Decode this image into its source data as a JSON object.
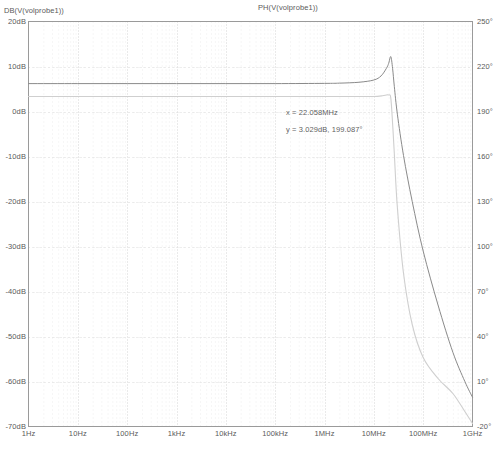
{
  "window": {
    "title": "AC Analysis Waveform Viewer"
  },
  "titles": {
    "left_trace": "DB(V(volprobe1))",
    "right_trace": "PH(V(volprobe1))"
  },
  "annotation": {
    "x_line": "x = 22.058MHz",
    "y_line": "y = 3.029dB, 199.087°"
  },
  "colors": {
    "magnitude_trace": "#8a8a8a",
    "phase_trace": "#cfcfcf",
    "frame": "#9a9a9a",
    "grid_major": "#d8d8d8",
    "grid_minor": "#e2e2e2",
    "text": "#5a5a5a",
    "background": "#ffffff"
  },
  "chart_data": {
    "type": "line",
    "title": "",
    "subtitle": "",
    "xlabel": "",
    "x_scale": "log",
    "xlim": [
      1,
      1000000000
    ],
    "xticks": [
      1,
      10,
      100,
      1000,
      10000,
      100000,
      1000000,
      10000000,
      100000000,
      1000000000
    ],
    "xticklabels": [
      "1Hz",
      "10Hz",
      "100Hz",
      "1kHz",
      "10kHz",
      "100kHz",
      "1MHz",
      "10MHz",
      "100MHz",
      "1GHz"
    ],
    "grid": true,
    "legend_position": "top",
    "axes": [
      {
        "name": "magnitude",
        "side": "left",
        "ylabel": "",
        "ylim": [
          -70,
          20
        ],
        "yticks": [
          20,
          10,
          0,
          -10,
          -20,
          -30,
          -40,
          -50,
          -60,
          -70
        ],
        "yticklabels": [
          "20dB",
          "10dB",
          "0dB",
          "-10dB",
          "-20dB",
          "-30dB",
          "-40dB",
          "-50dB",
          "-60dB",
          "-70dB"
        ]
      },
      {
        "name": "phase",
        "side": "right",
        "ylabel": "",
        "ylim": [
          -20,
          250
        ],
        "yticks": [
          250,
          220,
          190,
          160,
          130,
          100,
          70,
          40,
          10,
          -20
        ],
        "yticklabels": [
          "250°",
          "220°",
          "190°",
          "160°",
          "130°",
          "100°",
          "70°",
          "40°",
          "10°",
          "-20°"
        ]
      }
    ],
    "series": [
      {
        "name": "DB(V(volprobe1))",
        "axis": "magnitude",
        "units": "dB",
        "color": "#8a8a8a",
        "x": [
          1,
          10,
          100,
          1000,
          10000,
          100000,
          1000000,
          2000000,
          5000000,
          10000000,
          14000000,
          18000000,
          20000000,
          22058000,
          24000000,
          26000000,
          30000000,
          40000000,
          60000000,
          100000000,
          200000000,
          400000000,
          700000000,
          1000000000
        ],
        "y": [
          6.2,
          6.2,
          6.2,
          6.2,
          6.2,
          6.2,
          6.25,
          6.3,
          6.5,
          7.0,
          7.9,
          9.6,
          10.7,
          12.2,
          9.6,
          5.6,
          -0.6,
          -9.8,
          -20.0,
          -31.0,
          -43.0,
          -53.5,
          -60.0,
          -63.5
        ]
      },
      {
        "name": "PH(V(volprobe1))",
        "axis": "phase",
        "units": "deg",
        "color": "#cfcfcf",
        "x": [
          1,
          10,
          100,
          1000,
          10000,
          100000,
          1000000,
          5000000,
          10000000,
          15000000,
          18000000,
          20000000,
          22058000,
          24000000,
          26000000,
          30000000,
          40000000,
          60000000,
          100000000,
          200000000,
          400000000,
          700000000,
          1000000000
        ],
        "y": [
          200.0,
          200.0,
          200.0,
          200.0,
          200.0,
          200.0,
          200.0,
          200.0,
          200.0,
          200.5,
          201.0,
          201.0,
          199.1,
          182.0,
          162.0,
          126.0,
          82.0,
          48.0,
          26.0,
          12.0,
          2.0,
          -10.0,
          -18.0
        ]
      }
    ],
    "annotations": [
      {
        "text_lines": [
          "x = 22.058MHz",
          "y = 3.029dB, 199.087°"
        ],
        "x_value": 22058000,
        "y_value_db": 3.029,
        "y_value_deg": 199.087
      }
    ]
  }
}
